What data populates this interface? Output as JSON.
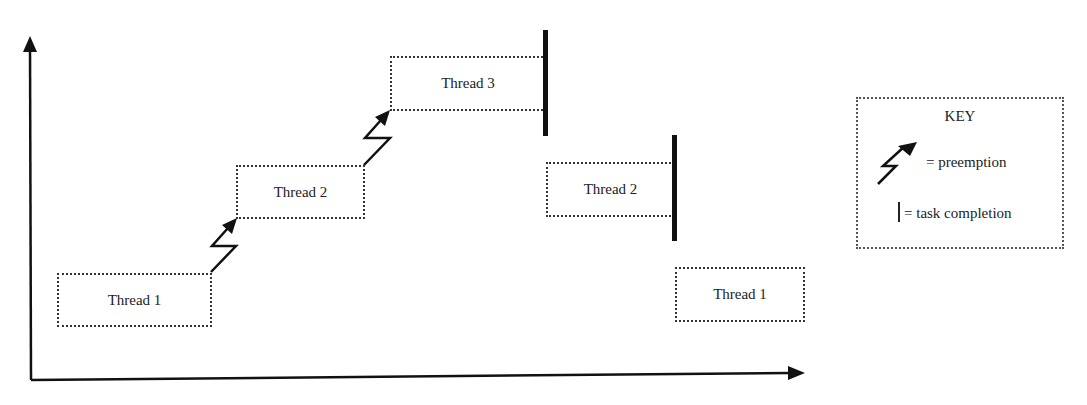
{
  "diagram": {
    "type": "thread-preemption-timeline",
    "blocks": [
      {
        "id": "t1a",
        "label": "Thread 1"
      },
      {
        "id": "t2a",
        "label": "Thread 2"
      },
      {
        "id": "t3",
        "label": "Thread 3"
      },
      {
        "id": "t2b",
        "label": "Thread 2"
      },
      {
        "id": "t1b",
        "label": "Thread 1"
      }
    ],
    "events": [
      {
        "type": "preemption",
        "from": "Thread 1",
        "to": "Thread 2"
      },
      {
        "type": "preemption",
        "from": "Thread 2",
        "to": "Thread 3"
      },
      {
        "type": "task completion",
        "thread": "Thread 3"
      },
      {
        "type": "task completion",
        "thread": "Thread 2"
      }
    ],
    "key": {
      "title": "KEY",
      "preemption": "= preemption",
      "completion": "= task completion"
    }
  }
}
